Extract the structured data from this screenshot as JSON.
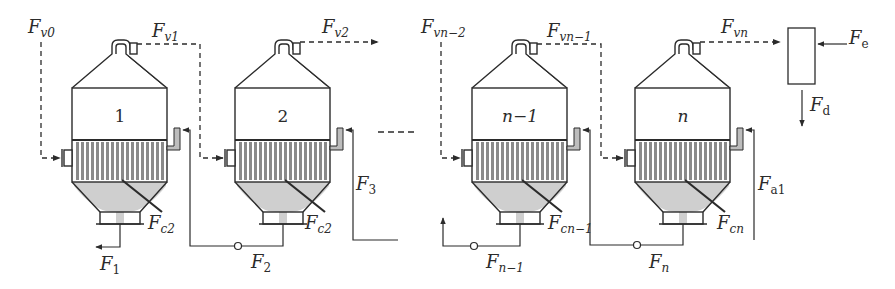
{
  "diagram": {
    "colors": {
      "line": "#2b2b2b",
      "tubes": "#8a8a8a",
      "liquid": "#cfcfcf",
      "steam_pipe": "#bdbdbd",
      "background": "#ffffff"
    },
    "vessels": [
      {
        "id": "effect-1",
        "label": "1",
        "offset_x": 0
      },
      {
        "id": "effect-2",
        "label": "2",
        "offset_x": 163
      },
      {
        "id": "effect-n-1",
        "label": "n−1",
        "offset_x": 400
      },
      {
        "id": "effect-n",
        "label": "n",
        "offset_x": 563
      }
    ],
    "ellipsis": "----",
    "labels": {
      "Fv0": {
        "main": "F",
        "sub": "v0"
      },
      "Fv1": {
        "main": "F",
        "sub": "v1"
      },
      "Fv2": {
        "main": "F",
        "sub": "v2"
      },
      "Fvn2": {
        "main": "F",
        "sub": "vn−2"
      },
      "Fvn1": {
        "main": "F",
        "sub": "vn−1"
      },
      "Fvn": {
        "main": "F",
        "sub": "vn"
      },
      "Fe": {
        "main": "F",
        "sub": "e"
      },
      "Fd": {
        "main": "F",
        "sub": "d"
      },
      "Fc2a": {
        "main": "F",
        "sub": "c2"
      },
      "Fc2b": {
        "main": "F",
        "sub": "c2"
      },
      "Fcn1": {
        "main": "F",
        "sub": "cn−1"
      },
      "Fcn": {
        "main": "F",
        "sub": "cn"
      },
      "F1": {
        "main": "F",
        "sub": "1"
      },
      "F2": {
        "main": "F",
        "sub": "2"
      },
      "F3": {
        "main": "F",
        "sub": "3"
      },
      "Fn1": {
        "main": "F",
        "sub": "n−1"
      },
      "Fn": {
        "main": "F",
        "sub": "n"
      },
      "Fa1": {
        "main": "F",
        "sub": "a1"
      }
    }
  }
}
